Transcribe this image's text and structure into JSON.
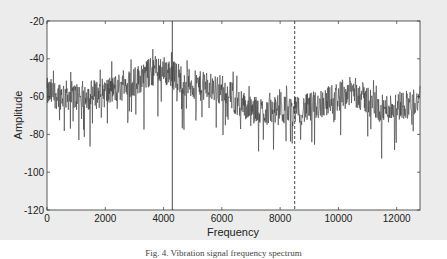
{
  "chart_data": {
    "type": "line",
    "title": "",
    "xlabel": "Frequency",
    "ylabel": "Amplitude",
    "xlim": [
      0,
      12800
    ],
    "ylim": [
      -120,
      -20
    ],
    "x_ticks": [
      0,
      2000,
      4000,
      6000,
      8000,
      10000,
      12000
    ],
    "y_ticks": [
      -20,
      -40,
      -60,
      -80,
      -100,
      -120
    ],
    "grid": false,
    "legend": null,
    "series": [
      {
        "name": "spectrum",
        "style": "noisy line",
        "envelope_x": [
          0,
          1000,
          2000,
          3000,
          3800,
          4300,
          5000,
          6000,
          6500,
          7000,
          8000,
          8500,
          9000,
          10000,
          10500,
          11500,
          12000,
          12800
        ],
        "envelope_mean_y": [
          -58,
          -60,
          -58,
          -52,
          -45,
          -48,
          -54,
          -56,
          -62,
          -68,
          -67,
          -68,
          -66,
          -60,
          -57,
          -67,
          -65,
          -62
        ],
        "noise_amplitude_db": 8
      }
    ],
    "annotations": [
      {
        "type": "vline",
        "x": 4300,
        "style": "solid"
      },
      {
        "type": "vline",
        "x": 8500,
        "style": "dashed"
      }
    ]
  },
  "caption": "Fig. 4. Vibration signal frequency spectrum"
}
